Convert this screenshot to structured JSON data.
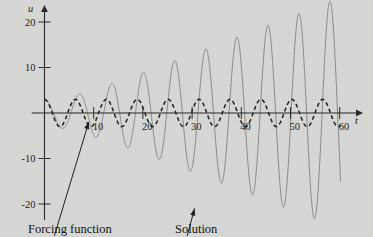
{
  "figure": {
    "background_color": "#d9d9d6",
    "solution_color": "#8a8a8a",
    "forcing_color": "#1f1f1f",
    "axis_color": "#2b2b2b"
  },
  "annotations": {
    "forcing_caption": "Forcing function",
    "solution_caption": "Solution"
  },
  "chart_data": {
    "type": "line",
    "title": "",
    "xlabel": "t",
    "ylabel": "u",
    "xlim": [
      -2,
      63
    ],
    "ylim": [
      -25,
      24
    ],
    "grid": false,
    "legend_position": "below-axes-as-captions",
    "xticks": [
      10,
      20,
      30,
      40,
      50,
      60
    ],
    "xticklabels": [
      "10",
      "20",
      "30",
      "40",
      "50",
      "60"
    ],
    "yticks": [
      -20,
      -10,
      10,
      20
    ],
    "yticklabels": [
      "-20",
      "-10",
      "10",
      "20"
    ],
    "annotations": [
      {
        "label": "Forcing function",
        "points_to_x": 9.0,
        "points_to_y": -2.0,
        "text_x": 2.0,
        "text_y": -27.0
      },
      {
        "label": "Solution",
        "points_to_x": 30.5,
        "points_to_y": -21.0,
        "text_x": 29.0,
        "text_y": -27.0
      }
    ],
    "series": [
      {
        "name": "Forcing function",
        "style": "dashed",
        "color": "#1f1f1f",
        "formula": "u = 3*cos(t)",
        "amplitude": 3,
        "period": 6.283,
        "x": [
          0,
          60
        ],
        "description": "Constant-amplitude cosine of amplitude 3, period 2*pi"
      },
      {
        "name": "Solution",
        "style": "solid",
        "color": "#8a8a8a",
        "formula": "u = 0.42*t*sin(t) + 3*cos(t)",
        "growth_rate": 0.42,
        "period": 6.283,
        "x": [
          0,
          60
        ],
        "description": "Resonant response whose envelope grows linearly with t; local maxima approximately 9, 14, 17, 20, 21, 22, 22.5, 23, 23.5, 24",
        "peak_t": [
          7.0,
          13.5,
          19.8,
          26.1,
          32.4,
          38.7,
          45.0,
          51.3,
          57.6
        ],
        "peak_u": [
          9,
          14,
          17,
          20,
          21.5,
          22.5,
          23,
          23.5,
          24
        ],
        "trough_t": [
          10.3,
          16.6,
          22.9,
          29.2,
          35.5,
          41.8,
          48.1,
          54.4
        ],
        "trough_u": [
          -12,
          -16,
          -18.5,
          -21.5,
          -22,
          -22.5,
          -23,
          -23.5
        ]
      }
    ]
  }
}
